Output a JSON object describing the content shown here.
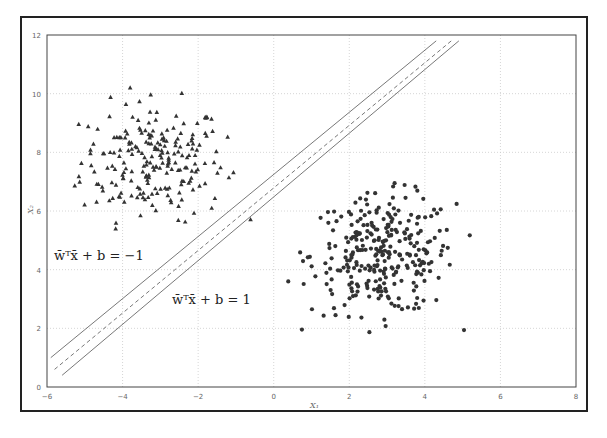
{
  "chart_data": {
    "type": "scatter",
    "title": "",
    "xlabel": "X1",
    "ylabel": "X2",
    "xlim": [
      -6,
      8
    ],
    "ylim": [
      0,
      12
    ],
    "xticks": [
      "-6",
      "-4",
      "-2",
      "0",
      "2",
      "4",
      "6",
      "8"
    ],
    "yticks": [
      "0",
      "2",
      "4",
      "6",
      "8",
      "10",
      "12"
    ],
    "grid": true,
    "legend": null,
    "series": [
      {
        "name": "class -1 (triangles)",
        "marker": "triangle",
        "center": [
          -3.2,
          7.7
        ],
        "spread": [
          0.95,
          1.0
        ],
        "count": 220,
        "x_range": [
          -5.3,
          -0.5
        ],
        "y_range": [
          5.1,
          10.9
        ]
      },
      {
        "name": "class +1 (circles)",
        "marker": "circle",
        "center": [
          2.9,
          4.5
        ],
        "spread": [
          0.95,
          1.0
        ],
        "count": 300,
        "x_range": [
          0.3,
          5.5
        ],
        "y_range": [
          1.7,
          7.7
        ]
      }
    ],
    "lines": [
      {
        "name": "margin -1",
        "style": "solid",
        "from": [
          -5.9,
          1.0
        ],
        "to": [
          4.3,
          11.8
        ]
      },
      {
        "name": "decision boundary",
        "style": "dashed",
        "from": [
          -5.8,
          0.6
        ],
        "to": [
          4.7,
          11.8
        ]
      },
      {
        "name": "margin +1",
        "style": "solid",
        "from": [
          -5.6,
          0.4
        ],
        "to": [
          4.9,
          11.8
        ]
      }
    ],
    "annotations": [
      {
        "text": "w̄ᵀx̄ + b = −1",
        "x": -5.2,
        "y": 4.6
      },
      {
        "text": "w̄ᵀx̄ + b = 1",
        "x": -3.0,
        "y": 3.1
      }
    ]
  },
  "labels": {
    "xlabel": "X₁",
    "ylabel": "X₂",
    "eq_neg": "w̄ᵀx̄ + b = −1",
    "eq_pos": "w̄ᵀx̄ + b = 1"
  },
  "colors": {
    "points": "#333333",
    "lines": "#555555",
    "grid": "#cccccc",
    "axes": "#444444"
  }
}
